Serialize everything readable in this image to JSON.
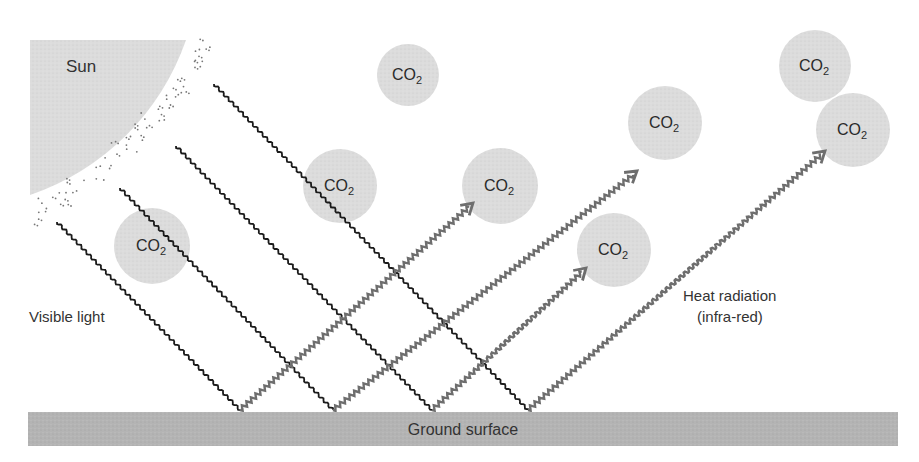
{
  "diagram": {
    "colors": {
      "background": "#ffffff",
      "sun_fill": "#dcdcdc",
      "molecule_fill": "#d8d8d8",
      "ground_fill": "#b4b4b4",
      "visible_light_stroke": "#1a1a1a",
      "heat_radiation_stroke": "#6e6e6e",
      "text": "#333333"
    },
    "labels": {
      "sun": "Sun",
      "visible_light": "Visible light",
      "heat_radiation_line1": "Heat radiation",
      "heat_radiation_line2": "(infra-red)",
      "ground": "Ground surface"
    },
    "molecule": {
      "formula_main": "CO",
      "formula_sub": "2"
    },
    "molecules": [
      {
        "id": "co2-1",
        "cx": 408,
        "cy": 75,
        "r": 31
      },
      {
        "id": "co2-2",
        "cx": 340,
        "cy": 186,
        "r": 37
      },
      {
        "id": "co2-3",
        "cx": 500,
        "cy": 186,
        "r": 38
      },
      {
        "id": "co2-4",
        "cx": 152,
        "cy": 246,
        "r": 38
      },
      {
        "id": "co2-5",
        "cx": 665,
        "cy": 123,
        "r": 37
      },
      {
        "id": "co2-6",
        "cx": 815,
        "cy": 66,
        "r": 36
      },
      {
        "id": "co2-7",
        "cx": 853,
        "cy": 130,
        "r": 37
      },
      {
        "id": "co2-8",
        "cx": 614,
        "cy": 250,
        "r": 37
      }
    ],
    "visible_light_rays": [
      {
        "x1": 57,
        "y1": 222,
        "x2": 240,
        "y2": 410
      },
      {
        "x1": 120,
        "y1": 188,
        "x2": 333,
        "y2": 410
      },
      {
        "x1": 176,
        "y1": 146,
        "x2": 432,
        "y2": 410
      },
      {
        "x1": 214,
        "y1": 84,
        "x2": 528,
        "y2": 410
      }
    ],
    "heat_radiation_rays": [
      {
        "x1": 240,
        "y1": 410,
        "x2": 473,
        "y2": 203
      },
      {
        "x1": 333,
        "y1": 410,
        "x2": 637,
        "y2": 171
      },
      {
        "x1": 432,
        "y1": 410,
        "x2": 586,
        "y2": 268
      },
      {
        "x1": 528,
        "y1": 410,
        "x2": 825,
        "y2": 151
      }
    ]
  }
}
